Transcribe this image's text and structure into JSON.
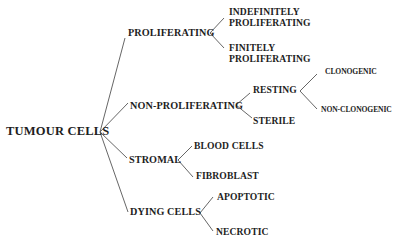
{
  "diagram": {
    "type": "tree",
    "root": "TUMOUR CELLS",
    "categories": {
      "proliferating": {
        "label": "PROLIFERATING",
        "children": {
          "indefinitely": {
            "line1": "INDEFINITELY",
            "line2": "PROLIFERATING"
          },
          "finitely": {
            "line1": "FINITELY",
            "line2": "PROLIFERATING"
          }
        }
      },
      "non_proliferating": {
        "label": "NON-PROLIFERATING",
        "children": {
          "resting": {
            "label": "RESTING",
            "children": {
              "clonogenic": "CLONOGENIC",
              "non_clonogenic": "NON-CLONOGENIC"
            }
          },
          "sterile": "STERILE"
        }
      },
      "stromal": {
        "label": "STROMAL",
        "children": {
          "blood_cells": "BLOOD CELLS",
          "fibroblast": "FIBROBLAST"
        }
      },
      "dying": {
        "label": "DYING CELLS",
        "children": {
          "apoptotic": "APOPTOTIC",
          "necrotic": "NECROTIC"
        }
      }
    },
    "colors": {
      "text": "#1e1e1e",
      "lines": "#555555",
      "background": "#ffffff"
    }
  }
}
